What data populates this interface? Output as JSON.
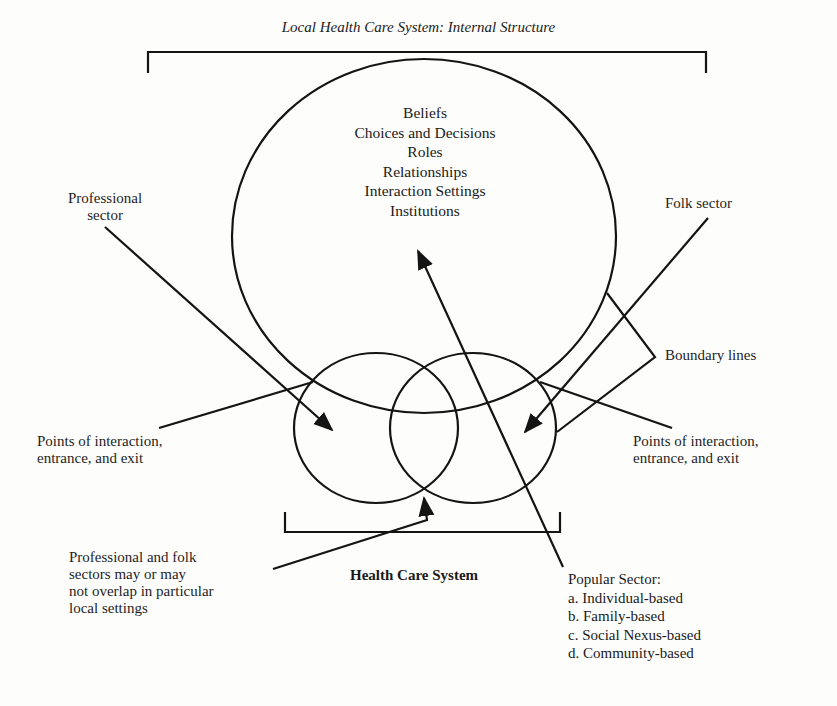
{
  "diagram": {
    "title": "Local Health Care System: Internal Structure",
    "central_elements": [
      "Beliefs",
      "Choices and Decisions",
      "Roles",
      "Relationships",
      "Interaction Settings",
      "Institutions"
    ],
    "labels": {
      "professional_sector": [
        "Professional",
        "sector"
      ],
      "folk_sector": "Folk sector",
      "boundary_lines": "Boundary lines",
      "points_left": [
        "Points of interaction,",
        "entrance, and exit"
      ],
      "points_right": [
        "Points of interaction,",
        "entrance, and exit"
      ],
      "overlap_note": [
        "Professional and folk",
        "sectors may or may",
        "not overlap in particular",
        "local settings"
      ],
      "health_care_system": "Health Care System"
    },
    "popular_sector": {
      "heading": "Popular Sector:",
      "items": [
        "a. Individual-based",
        "b. Family-based",
        "c. Social Nexus-based",
        "d. Community-based"
      ]
    },
    "colors": {
      "line": "#141414",
      "background": "#fdfdfc"
    }
  }
}
